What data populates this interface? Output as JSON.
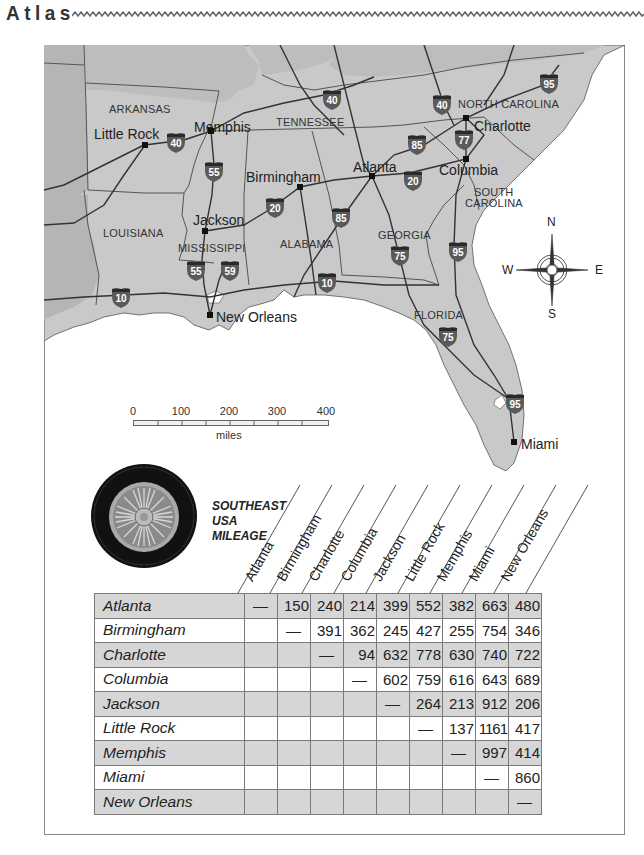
{
  "header": {
    "title": "Atlas"
  },
  "map": {
    "states": [
      {
        "name": "ARKANSAS",
        "x": 80,
        "y": 58
      },
      {
        "name": "TENNESSEE",
        "x": 234,
        "y": 70
      },
      {
        "name": "NORTH CAROLINA",
        "x": 416,
        "y": 53
      },
      {
        "name": "SOUTH",
        "x": 431,
        "y": 149
      },
      {
        "name": "CAROLINA",
        "x": 421,
        "y": 161
      },
      {
        "name": "LOUISIANA",
        "x": 62,
        "y": 182
      },
      {
        "name": "MISSISSIPPI",
        "x": 134,
        "y": 195
      },
      {
        "name": "ALABAMA",
        "x": 236,
        "y": 192
      },
      {
        "name": "GEORGIA",
        "x": 334,
        "y": 182
      },
      {
        "name": "FLORIDA",
        "x": 370,
        "y": 263
      }
    ],
    "cities": [
      {
        "name": "Little Rock",
        "x": 49,
        "y": 81,
        "dot_x": 101,
        "dot_y": 100
      },
      {
        "name": "Memphis",
        "x": 149,
        "y": 74,
        "dot_x": 167,
        "dot_y": 86
      },
      {
        "name": "Birmingham",
        "x": 201,
        "y": 124,
        "dot_x": 256,
        "dot_y": 142
      },
      {
        "name": "Atlanta",
        "x": 308,
        "y": 114,
        "dot_x": 328,
        "dot_y": 131
      },
      {
        "name": "Charlotte",
        "x": 428,
        "y": 73,
        "dot_x": 422,
        "dot_y": 73
      },
      {
        "name": "Columbia",
        "x": 396,
        "y": 117,
        "dot_x": 422,
        "dot_y": 114
      },
      {
        "name": "Jackson",
        "x": 148,
        "y": 167,
        "dot_x": 161,
        "dot_y": 186
      },
      {
        "name": "New Orleans",
        "x": 172,
        "y": 264,
        "dot_x": 166,
        "dot_y": 270
      },
      {
        "name": "Miami",
        "x": 476,
        "y": 391,
        "dot_x": 470,
        "dot_y": 397
      }
    ],
    "interstates": [
      {
        "num": "40",
        "x": 120,
        "y": 86
      },
      {
        "num": "40",
        "x": 277,
        "y": 44
      },
      {
        "num": "40",
        "x": 387,
        "y": 48
      },
      {
        "num": "95",
        "x": 495,
        "y": 28
      },
      {
        "num": "55",
        "x": 160,
        "y": 117
      },
      {
        "num": "85",
        "x": 363,
        "y": 89
      },
      {
        "num": "77",
        "x": 410,
        "y": 85
      },
      {
        "num": "20",
        "x": 359,
        "y": 125
      },
      {
        "name": "",
        "num": "20",
        "x": 221,
        "y": 153
      },
      {
        "num": "85",
        "x": 288,
        "y": 163
      },
      {
        "num": "75",
        "x": 346,
        "y": 200
      },
      {
        "num": "95",
        "x": 404,
        "y": 196
      },
      {
        "num": "55",
        "x": 142,
        "y": 215
      },
      {
        "num": "59",
        "x": 175,
        "y": 215
      },
      {
        "num": "10",
        "x": 66,
        "y": 242
      },
      {
        "num": "10",
        "x": 273,
        "y": 227
      },
      {
        "num": "75",
        "x": 394,
        "y": 281
      },
      {
        "num": "95",
        "x": 461,
        "y": 348
      }
    ],
    "compass": {
      "n": "N",
      "s": "S",
      "e": "E",
      "w": "W"
    },
    "scale": {
      "ticks": [
        "0",
        "100",
        "200",
        "300",
        "400"
      ],
      "unit": "miles"
    }
  },
  "mileage": {
    "title_lines": [
      "SOUTHEAST",
      "USA",
      "MILEAGE"
    ],
    "columns": [
      "Atlanta",
      "Birmingham",
      "Charlotte",
      "Columbia",
      "Jackson",
      "Little Rock",
      "Memphis",
      "Miami",
      "New Orleans"
    ],
    "rows": [
      {
        "name": "Atlanta",
        "values": [
          "—",
          "150",
          "240",
          "214",
          "399",
          "552",
          "382",
          "663",
          "480"
        ]
      },
      {
        "name": "Birmingham",
        "values": [
          "",
          "—",
          "391",
          "362",
          "245",
          "427",
          "255",
          "754",
          "346"
        ]
      },
      {
        "name": "Charlotte",
        "values": [
          "",
          "",
          "—",
          "94",
          "632",
          "778",
          "630",
          "740",
          "722"
        ]
      },
      {
        "name": "Columbia",
        "values": [
          "",
          "",
          "",
          "—",
          "602",
          "759",
          "616",
          "643",
          "689"
        ]
      },
      {
        "name": "Jackson",
        "values": [
          "",
          "",
          "",
          "",
          "—",
          "264",
          "213",
          "912",
          "206"
        ]
      },
      {
        "name": "Little Rock",
        "values": [
          "",
          "",
          "",
          "",
          "",
          "—",
          "137",
          "1161",
          "417"
        ]
      },
      {
        "name": "Memphis",
        "values": [
          "",
          "",
          "",
          "",
          "",
          "",
          "—",
          "997",
          "414"
        ]
      },
      {
        "name": "Miami",
        "values": [
          "",
          "",
          "",
          "",
          "",
          "",
          "",
          "—",
          "860"
        ]
      },
      {
        "name": "New Orleans",
        "values": [
          "",
          "",
          "",
          "",
          "",
          "",
          "",
          "",
          "—"
        ]
      }
    ]
  },
  "colors": {
    "land": "#c9c9c9",
    "land_dark": "#b3b3b3",
    "water": "#ffffff",
    "road": "#3a3a3a",
    "shield": "#5a5a5a",
    "row_shade": "#d6d6d6"
  }
}
